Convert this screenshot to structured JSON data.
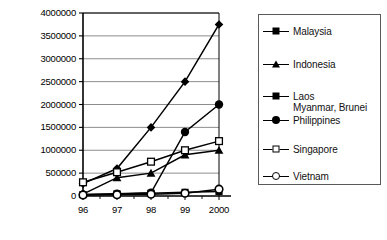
{
  "chart_data": {
    "type": "line",
    "title": "",
    "xlabel": "",
    "ylabel": "",
    "x": [
      "96",
      "97",
      "98",
      "99",
      "2000"
    ],
    "categories": [
      "96",
      "97",
      "98",
      "99",
      "2000"
    ],
    "ylim": [
      0,
      4000000
    ],
    "xlim_index": [
      0,
      4
    ],
    "yticks": [
      0,
      500000,
      1000000,
      1500000,
      2000000,
      2500000,
      3000000,
      3500000,
      4000000
    ],
    "ytick_labels": [
      "0",
      "500000",
      "1000000",
      "1500000",
      "2000000",
      "2500000",
      "3000000",
      "3500000",
      "4000000"
    ],
    "xtick_labels": [
      "96",
      "97",
      "98",
      "99",
      "2000"
    ],
    "grid": "horizontal",
    "legend_position": "right",
    "series": [
      {
        "name": "Malaysia",
        "marker": "diamond",
        "values": [
          270000,
          600000,
          1500000,
          2500000,
          3750000
        ]
      },
      {
        "name": "Indonesia",
        "marker": "triangle",
        "values": [
          40000,
          400000,
          500000,
          900000,
          1000000
        ]
      },
      {
        "name": "Laos",
        "name_extra": "Myanmar, Brunei",
        "marker": "square",
        "values": [
          30000,
          45000,
          60000,
          80000,
          100000
        ]
      },
      {
        "name": "Philippines",
        "marker": "circle",
        "values": [
          35000,
          50000,
          70000,
          1400000,
          2000000
        ]
      },
      {
        "name": "Singapore",
        "marker": "open-square",
        "values": [
          300000,
          520000,
          750000,
          1000000,
          1200000
        ]
      },
      {
        "name": "Vietnam",
        "marker": "open-circle",
        "values": [
          20000,
          30000,
          40000,
          60000,
          150000
        ]
      }
    ]
  },
  "legend": {
    "items": [
      {
        "label": "Malaysia",
        "marker": "diamond-icon"
      },
      {
        "label": "Indonesia",
        "marker": "triangle-icon"
      },
      {
        "label": "Laos",
        "sublabel": "Myanmar, Brunei",
        "marker": "square-icon"
      },
      {
        "label": "Philippines",
        "marker": "circle-icon"
      },
      {
        "label": "Singapore",
        "marker": "open-square-icon"
      },
      {
        "label": "Vietnam",
        "marker": "open-circle-icon"
      }
    ]
  },
  "colors": {
    "series": "#000000",
    "grid": "#808080",
    "axis": "#000000",
    "background": "#ffffff"
  }
}
